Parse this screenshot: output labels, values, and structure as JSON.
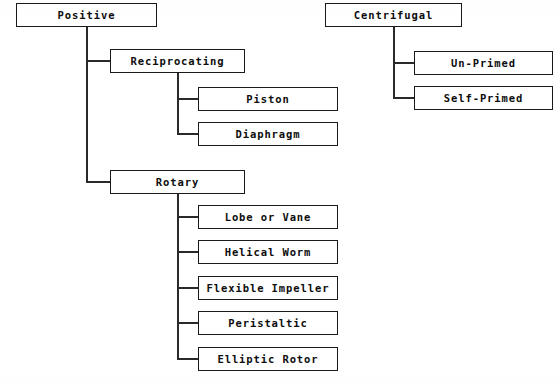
{
  "diagram": {
    "type": "hierarchy-tree",
    "line_color": "#2a2a2a",
    "box_border_color": "#1a1a1a",
    "text_color": "#0d0d0d",
    "background_color": "#ffffff",
    "nodes": [
      {
        "id": "positive",
        "label": "Positive",
        "x": 16,
        "y": 3,
        "w": 141,
        "h": 24,
        "level": 0,
        "parent": null
      },
      {
        "id": "reciprocating",
        "label": "Reciprocating",
        "x": 110,
        "y": 49,
        "w": 135,
        "h": 24,
        "level": 1,
        "parent": "positive"
      },
      {
        "id": "piston",
        "label": "Piston",
        "x": 198,
        "y": 87,
        "w": 140,
        "h": 24,
        "level": 2,
        "parent": "reciprocating"
      },
      {
        "id": "diaphragm",
        "label": "Diaphragm",
        "x": 198,
        "y": 122,
        "w": 140,
        "h": 24,
        "level": 2,
        "parent": "reciprocating"
      },
      {
        "id": "rotary",
        "label": "Rotary",
        "x": 110,
        "y": 170,
        "w": 135,
        "h": 24,
        "level": 1,
        "parent": "positive"
      },
      {
        "id": "lobe-or-vane",
        "label": "Lobe or Vane",
        "x": 198,
        "y": 205,
        "w": 140,
        "h": 24,
        "level": 2,
        "parent": "rotary"
      },
      {
        "id": "helical-worm",
        "label": "Helical Worm",
        "x": 198,
        "y": 240,
        "w": 140,
        "h": 24,
        "level": 2,
        "parent": "rotary"
      },
      {
        "id": "flexible-impeller",
        "label": "Flexible Impeller",
        "x": 198,
        "y": 276,
        "w": 140,
        "h": 24,
        "level": 2,
        "parent": "rotary"
      },
      {
        "id": "peristaltic",
        "label": "Peristaltic",
        "x": 198,
        "y": 311,
        "w": 140,
        "h": 24,
        "level": 2,
        "parent": "rotary"
      },
      {
        "id": "elliptic-rotor",
        "label": "Elliptic Rotor",
        "x": 198,
        "y": 347,
        "w": 140,
        "h": 24,
        "level": 2,
        "parent": "rotary"
      },
      {
        "id": "centrifugal",
        "label": "Centrifugal",
        "x": 325,
        "y": 3,
        "w": 137,
        "h": 24,
        "level": 0,
        "parent": null
      },
      {
        "id": "un-primed",
        "label": "Un-Primed",
        "x": 414,
        "y": 51,
        "w": 139,
        "h": 24,
        "level": 1,
        "parent": "centrifugal"
      },
      {
        "id": "self-primed",
        "label": "Self-Primed",
        "x": 414,
        "y": 86,
        "w": 139,
        "h": 24,
        "level": 1,
        "parent": "centrifugal"
      }
    ],
    "connectors": [
      {
        "id": "trunk-positive",
        "orient": "v",
        "x": 86,
        "y": 27,
        "len": 155,
        "from": "positive",
        "to": "rotary"
      },
      {
        "id": "stub-reciprocating",
        "orient": "h",
        "x": 86,
        "y": 60,
        "len": 25,
        "from": "positive",
        "to": "reciprocating"
      },
      {
        "id": "stub-rotary",
        "orient": "h",
        "x": 86,
        "y": 181,
        "len": 25,
        "from": "positive",
        "to": "rotary"
      },
      {
        "id": "trunk-reciprocating",
        "orient": "v",
        "x": 177,
        "y": 73,
        "len": 61,
        "from": "reciprocating",
        "to": "diaphragm"
      },
      {
        "id": "stub-piston",
        "orient": "h",
        "x": 177,
        "y": 98,
        "len": 22,
        "from": "reciprocating",
        "to": "piston"
      },
      {
        "id": "stub-diaphragm",
        "orient": "h",
        "x": 177,
        "y": 133,
        "len": 22,
        "from": "reciprocating",
        "to": "diaphragm"
      },
      {
        "id": "trunk-rotary",
        "orient": "v",
        "x": 177,
        "y": 194,
        "len": 165,
        "from": "rotary",
        "to": "elliptic-rotor"
      },
      {
        "id": "stub-lobe-or-vane",
        "orient": "h",
        "x": 177,
        "y": 216,
        "len": 22,
        "from": "rotary",
        "to": "lobe-or-vane"
      },
      {
        "id": "stub-helical-worm",
        "orient": "h",
        "x": 177,
        "y": 251,
        "len": 22,
        "from": "rotary",
        "to": "helical-worm"
      },
      {
        "id": "stub-flexible",
        "orient": "h",
        "x": 177,
        "y": 287,
        "len": 22,
        "from": "rotary",
        "to": "flexible-impeller"
      },
      {
        "id": "stub-peristaltic",
        "orient": "h",
        "x": 177,
        "y": 322,
        "len": 22,
        "from": "rotary",
        "to": "peristaltic"
      },
      {
        "id": "stub-elliptic",
        "orient": "h",
        "x": 177,
        "y": 358,
        "len": 22,
        "from": "rotary",
        "to": "elliptic-rotor"
      },
      {
        "id": "trunk-centrifugal",
        "orient": "v",
        "x": 393,
        "y": 27,
        "len": 71,
        "from": "centrifugal",
        "to": "self-primed"
      },
      {
        "id": "stub-un-primed",
        "orient": "h",
        "x": 393,
        "y": 62,
        "len": 22,
        "from": "centrifugal",
        "to": "un-primed"
      },
      {
        "id": "stub-self-primed",
        "orient": "h",
        "x": 393,
        "y": 97,
        "len": 22,
        "from": "centrifugal",
        "to": "self-primed"
      }
    ]
  }
}
